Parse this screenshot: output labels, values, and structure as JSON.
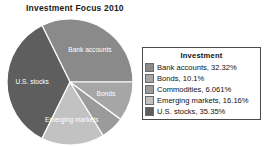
{
  "chart_data": {
    "type": "pie",
    "title": "Investment Focus 2010",
    "legend_title": "Investment",
    "legend_position": "right",
    "grid": false,
    "categories": [
      "Bank accounts",
      "Bonds",
      "Commodities",
      "Emerging markets",
      "U.S. stocks"
    ],
    "values": [
      32.32,
      10.1,
      6.061,
      16.16,
      35.35
    ],
    "value_unit": "%",
    "slices": [
      {
        "name": "Bank accounts",
        "value": 32.32,
        "legend_text": "Bank accounts, 32.32%",
        "slice_label": "Bank accounts",
        "color": "#8a8a8a"
      },
      {
        "name": "Bonds",
        "value": 10.1,
        "legend_text": "Bonds, 10.1%",
        "slice_label": "Bonds",
        "color": "#a6a6a6"
      },
      {
        "name": "Commodities",
        "value": 6.061,
        "legend_text": "Commodities, 6.061%",
        "slice_label": "",
        "color": "#9b9b9b"
      },
      {
        "name": "Emerging markets",
        "value": 16.16,
        "legend_text": "Emerging markets, 16.16%",
        "slice_label": "Emerging markets",
        "color": "#c2c2c2"
      },
      {
        "name": "U.S. stocks",
        "value": 35.35,
        "legend_text": "U.S. stocks, 35.35%",
        "slice_label": "U.S. stocks",
        "color": "#5e5e5e"
      }
    ],
    "geometry": {
      "center_x": 70,
      "center_y": 82,
      "radius": 63,
      "start_angle_deg": 0,
      "direction": "clockwise",
      "separator_color": "#ffffff"
    }
  }
}
